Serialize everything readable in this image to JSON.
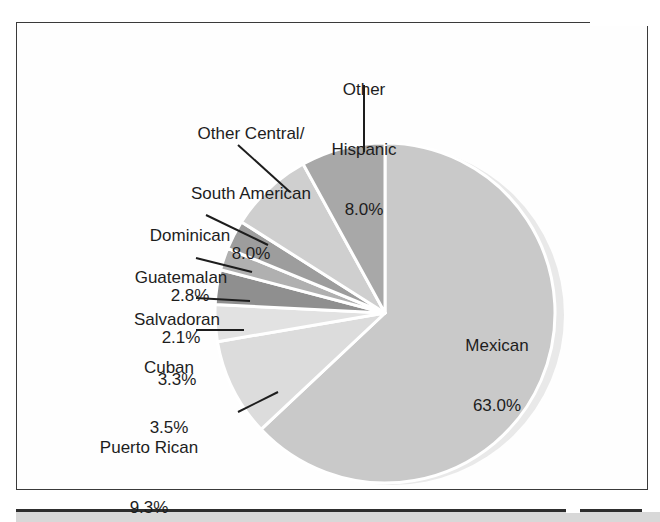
{
  "chart_data": {
    "type": "pie",
    "title": "",
    "subtitle": "",
    "xlabel": "",
    "ylabel": "",
    "legend_position": "none",
    "grid": false,
    "units": "percent",
    "start_angle_deg": 0,
    "direction": "clockwise",
    "categories": [
      "Mexican",
      "Puerto Rican",
      "Cuban",
      "Salvadoran",
      "Guatemalan",
      "Dominican",
      "Other Central/South American",
      "Other Hispanic"
    ],
    "values": [
      63.0,
      9.3,
      3.5,
      3.3,
      2.1,
      2.8,
      8.0,
      8.0
    ],
    "slices": [
      {
        "id": "mexican",
        "name": "Mexican",
        "name_lines": [
          "Mexican"
        ],
        "value": 63.0,
        "percent_label": "63.0%",
        "color": "#c9c9c9",
        "label_placement": "inside"
      },
      {
        "id": "puerto-rican",
        "name": "Puerto Rican",
        "name_lines": [
          "Puerto Rican"
        ],
        "value": 9.3,
        "percent_label": "9.3%",
        "color": "#dcdcdc",
        "label_placement": "outside"
      },
      {
        "id": "cuban",
        "name": "Cuban",
        "name_lines": [
          "Cuban"
        ],
        "value": 3.5,
        "percent_label": "3.5%",
        "color": "#e2e2e2",
        "label_placement": "outside"
      },
      {
        "id": "salvadoran",
        "name": "Salvadoran",
        "name_lines": [
          "Salvadoran"
        ],
        "value": 3.3,
        "percent_label": "3.3%",
        "color": "#8f8f8f",
        "label_placement": "outside"
      },
      {
        "id": "guatemalan",
        "name": "Guatemalan",
        "name_lines": [
          "Guatemalan"
        ],
        "value": 2.1,
        "percent_label": "2.1%",
        "color": "#b0b0b0",
        "label_placement": "outside"
      },
      {
        "id": "dominican",
        "name": "Dominican",
        "name_lines": [
          "Dominican"
        ],
        "value": 2.8,
        "percent_label": "2.8%",
        "color": "#9d9d9d",
        "label_placement": "outside"
      },
      {
        "id": "other-central-south-american",
        "name": "Other Central/South American",
        "name_lines": [
          "Other Central/",
          "South American"
        ],
        "value": 8.0,
        "percent_label": "8.0%",
        "color": "#cfcfcf",
        "label_placement": "outside"
      },
      {
        "id": "other-hispanic",
        "name": "Other Hispanic",
        "name_lines": [
          "Other",
          "Hispanic"
        ],
        "value": 8.0,
        "percent_label": "8.0%",
        "color": "#a8a8a8",
        "label_placement": "outside"
      }
    ],
    "total": 100.0
  },
  "style": {
    "slice_separator_color": "#ffffff",
    "label_text_color": "#1d1d1d",
    "leader_line_color": "#1d1d1d",
    "frame_border_color": "#3a3a3a",
    "page_background": "#ffffff",
    "bottom_rule_color": "#2e2e2e",
    "bottom_band_color": "#d8d8d8"
  },
  "labels": {
    "mexican": {
      "name": "Mexican",
      "pct": "63.0%"
    },
    "puerto_rican": {
      "name": "Puerto Rican",
      "pct": "9.3%"
    },
    "cuban": {
      "name": "Cuban",
      "pct": "3.5%"
    },
    "salvadoran": {
      "name": "Salvadoran",
      "pct": "3.3%"
    },
    "guatemalan": {
      "name": "Guatemalan",
      "pct": "2.1%"
    },
    "dominican": {
      "name": "Dominican",
      "pct": "2.8%"
    },
    "other_cs_american": {
      "name_line1": "Other Central/",
      "name_line2": "South American",
      "pct": "8.0%"
    },
    "other_hispanic": {
      "name_line1": "Other",
      "name_line2": "Hispanic",
      "pct": "8.0%"
    }
  }
}
